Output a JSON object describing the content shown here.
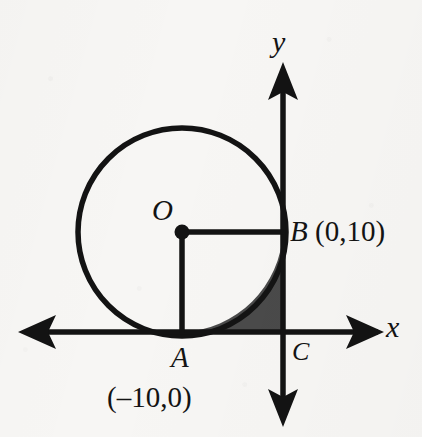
{
  "figure": {
    "background_color": "#f7f6f4",
    "stroke_color": "#131313",
    "shade_color": "#4a4a4a",
    "axes": {
      "x_label": "x",
      "y_label": "y",
      "x_axis_y": 332,
      "y_axis_x": 283
    },
    "circle": {
      "center_x": 182,
      "center_y": 232,
      "radius": 105,
      "center_label": "O"
    },
    "points": [
      {
        "name": "O",
        "label": "O",
        "coord_label": "",
        "x": 182,
        "y": 232
      },
      {
        "name": "A",
        "label": "A",
        "coord_label": "(–10,0)",
        "x": 182,
        "y": 332
      },
      {
        "name": "B",
        "label": "B",
        "coord_label": "(0,10)",
        "x": 283,
        "y": 232
      },
      {
        "name": "C",
        "label": "C",
        "coord_label": "",
        "x": 283,
        "y": 332
      }
    ],
    "labels": {
      "O": "O",
      "A": "A",
      "A_coord": "(–10,0)",
      "B": "B",
      "B_coord": "(0,10)",
      "C": "C",
      "x": "x",
      "y": "y"
    }
  }
}
